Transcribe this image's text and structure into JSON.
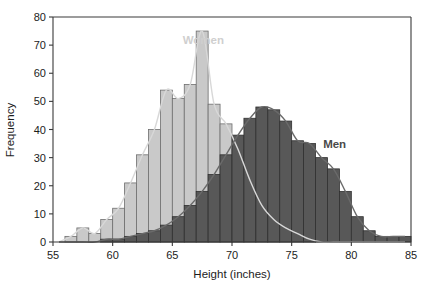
{
  "chart_data": {
    "type": "bar",
    "subtype": "overlapping-histogram",
    "title": "",
    "xlabel": "Height (inches)",
    "ylabel": "Frequency",
    "xlim": [
      55,
      85
    ],
    "ylim": [
      0,
      80
    ],
    "xticks": [
      55,
      60,
      65,
      70,
      75,
      80,
      85
    ],
    "yticks": [
      0,
      10,
      20,
      30,
      40,
      50,
      60,
      70,
      80
    ],
    "grid": false,
    "legend_position": "inline-annotations",
    "bin_width": 1,
    "bin_starts": [
      55,
      56,
      57,
      58,
      59,
      60,
      61,
      62,
      63,
      64,
      65,
      66,
      67,
      68,
      69,
      70,
      71,
      72,
      73,
      74,
      75,
      76,
      77,
      78,
      79,
      80,
      81,
      82,
      83,
      84
    ],
    "series": [
      {
        "name": "Women",
        "color": "#c9c9c9",
        "curve_color": "#d8d8d8",
        "label_color": "#cfcfcf",
        "values": [
          0,
          2,
          5,
          3,
          8,
          12,
          21,
          31,
          40,
          54,
          51,
          56,
          75,
          49,
          42,
          33,
          22,
          13,
          8,
          5,
          3,
          1,
          0,
          0,
          0,
          0,
          0,
          0,
          0,
          0
        ]
      },
      {
        "name": "Men",
        "color": "#585858",
        "curve_color": "#6a6a6a",
        "label_color": "#4a4a4a",
        "values": [
          0,
          0,
          0,
          0,
          1,
          1,
          2,
          3,
          4,
          6,
          9,
          13,
          18,
          24,
          31,
          38,
          44,
          48,
          47,
          43,
          36,
          35,
          30,
          26,
          18,
          9,
          4,
          2,
          2,
          2
        ]
      }
    ],
    "annotations": [
      {
        "text": "Women",
        "x": 67.6,
        "y": 70.5
      },
      {
        "text": "Men",
        "x": 78.6,
        "y": 33.5
      }
    ]
  },
  "axes": {
    "ylabel": "Frequency",
    "xlabel": "Height (inches)",
    "xtick_labels": [
      "55",
      "60",
      "65",
      "70",
      "75",
      "80",
      "85"
    ],
    "ytick_labels": [
      "0",
      "10",
      "20",
      "30",
      "40",
      "50",
      "60",
      "70",
      "80"
    ]
  }
}
